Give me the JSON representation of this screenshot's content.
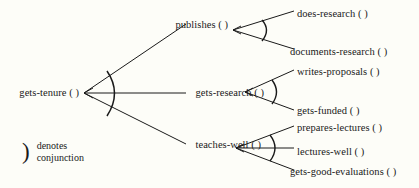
{
  "diagram": {
    "background_color": "#fdfdf8",
    "line_color": "#1a1a1a",
    "root": {
      "id": "gets-tenure",
      "label": "gets-tenure ( )",
      "conjunction": true
    },
    "level2": [
      {
        "id": "publishes",
        "label": "publishes ( )",
        "conjunction": true
      },
      {
        "id": "gets-research",
        "label": "gets-research ( )",
        "conjunction": true
      },
      {
        "id": "teaches-well",
        "label": "teaches-well ( )",
        "conjunction": true
      }
    ],
    "level3": [
      {
        "id": "does-research",
        "label": "does-research ( )",
        "parent": "publishes"
      },
      {
        "id": "documents-research",
        "label": "documents-research ( )",
        "parent": "publishes"
      },
      {
        "id": "writes-proposals",
        "label": "writes-proposals ( )",
        "parent": "gets-research"
      },
      {
        "id": "gets-funded",
        "label": "gets-funded ( )",
        "parent": "gets-research"
      },
      {
        "id": "prepares-lectures",
        "label": "prepares-lectures ( )",
        "parent": "teaches-well"
      },
      {
        "id": "lectures-well",
        "label": "lectures-well ( )",
        "parent": "teaches-well"
      },
      {
        "id": "gets-good-evaluations",
        "label": "gets-good-evaluations ( )",
        "parent": "teaches-well"
      }
    ],
    "legend": {
      "symbol": ")",
      "text": "denotes\nconjunction"
    }
  }
}
